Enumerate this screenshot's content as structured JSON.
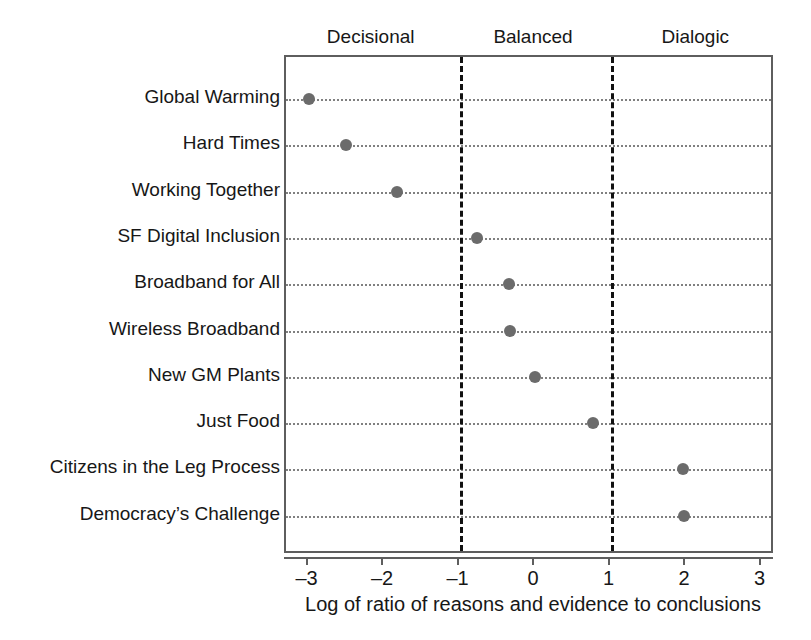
{
  "chart_data": {
    "type": "scatter",
    "title": "",
    "xlabel": "Log of ratio of reasons and evidence to conclusions",
    "ylabel": "",
    "xlim": [
      -3.3,
      3.3
    ],
    "xticks": [
      -3,
      -2,
      -1,
      0,
      1,
      2,
      3
    ],
    "xticklabels": [
      "–3",
      "–2",
      "–1",
      "0",
      "1",
      "2",
      "3"
    ],
    "grid": "dotted-horizontal-per-category",
    "legend": "none",
    "orientation": "horizontal-dot-plot",
    "categories": [
      "Global Warming",
      "Hard Times",
      "Working Together",
      "SF Digital Inclusion",
      "Broadband for All",
      "Wireless Broadband",
      "New GM Plants",
      "Just Food",
      "Citizens in the Leg Process",
      "Democracy’s Challenge"
    ],
    "values": [
      -3.0,
      -2.5,
      -1.83,
      -0.77,
      -0.34,
      -0.33,
      0.0,
      0.77,
      1.96,
      1.97
    ],
    "points": [
      {
        "label": "Global Warming",
        "value": -3.0
      },
      {
        "label": "Hard Times",
        "value": -2.5
      },
      {
        "label": "Working Together",
        "value": -1.83
      },
      {
        "label": "SF Digital Inclusion",
        "value": -0.77
      },
      {
        "label": "Broadband for All",
        "value": -0.34
      },
      {
        "label": "Wireless Broadband",
        "value": -0.33
      },
      {
        "label": "New GM Plants",
        "value": 0.0
      },
      {
        "label": "Just Food",
        "value": 0.77
      },
      {
        "label": "Citizens in the Leg Process",
        "value": 1.96
      },
      {
        "label": "Democracy’s Challenge",
        "value": 1.97
      }
    ],
    "threshold_lines": [
      -1,
      1
    ],
    "annotations": [
      {
        "text": "Decisional",
        "range": [
          -3.3,
          -1
        ],
        "position": "top"
      },
      {
        "text": "Balanced",
        "range": [
          -1,
          1
        ],
        "position": "top"
      },
      {
        "text": "Dialogic",
        "range": [
          1,
          3.3
        ],
        "position": "top"
      }
    ],
    "colors": {
      "marker": "#6b6b6b",
      "frame": "#5e5e5e",
      "guide": "#808080",
      "threshold": "#111111",
      "text": "#171717",
      "background": "#ffffff"
    }
  }
}
